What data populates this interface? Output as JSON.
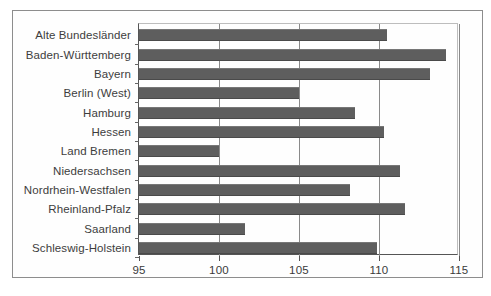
{
  "chart_data": {
    "type": "bar",
    "orientation": "horizontal",
    "title": "",
    "subtitle": "",
    "xlabel": "",
    "ylabel": "",
    "xlim": [
      95,
      115
    ],
    "ylim": null,
    "grid": true,
    "legend": null,
    "xticks": [
      "95",
      "100",
      "105",
      "110",
      "115"
    ],
    "xtick_values": [
      95,
      100,
      105,
      110,
      115
    ],
    "categories": [
      "Alte Bundesländer",
      "Baden-Württemberg",
      "Bayern",
      "Berlin (West)",
      "Hamburg",
      "Hessen",
      "Land Bremen",
      "Niedersachsen",
      "Nordrhein-Westfalen",
      "Rheinland-Pfalz",
      "Saarland",
      "Schleswig-Holstein"
    ],
    "values": [
      110.5,
      114.2,
      113.2,
      105.0,
      108.5,
      110.3,
      100.0,
      111.3,
      108.2,
      111.6,
      101.6,
      109.9
    ],
    "series": [
      {
        "name": "Index",
        "values": [
          110.5,
          114.2,
          113.2,
          105.0,
          108.5,
          110.3,
          100.0,
          111.3,
          108.2,
          111.6,
          101.6,
          109.9
        ]
      }
    ],
    "bar_color": "#5e5e5e",
    "axis_color": "#555555",
    "grid_color": "#8a8a8a",
    "background_color": "#ffffff"
  }
}
